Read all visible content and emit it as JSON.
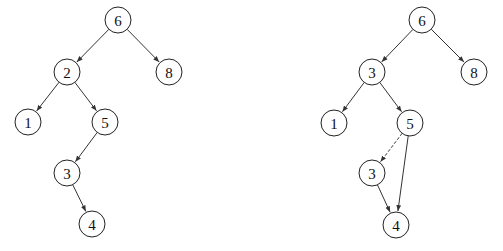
{
  "diagram": {
    "type": "binary-search-tree-comparison",
    "node_radius": 13,
    "colors": {
      "stroke": "#222222",
      "fill": "#ffffff",
      "text": "#111111"
    },
    "trees": [
      {
        "name": "left-tree",
        "nodes": [
          {
            "id": "L6",
            "label": "6",
            "x": 118,
            "y": 20
          },
          {
            "id": "L2",
            "label": "2",
            "x": 67,
            "y": 72
          },
          {
            "id": "L8",
            "label": "8",
            "x": 169,
            "y": 72
          },
          {
            "id": "L1",
            "label": "1",
            "x": 28,
            "y": 122
          },
          {
            "id": "L5",
            "label": "5",
            "x": 105,
            "y": 122
          },
          {
            "id": "L3",
            "label": "3",
            "x": 67,
            "y": 173
          },
          {
            "id": "L4",
            "label": "4",
            "x": 92,
            "y": 224
          }
        ],
        "edges": [
          {
            "from": "L6",
            "to": "L2",
            "style": "solid"
          },
          {
            "from": "L6",
            "to": "L8",
            "style": "solid"
          },
          {
            "from": "L2",
            "to": "L1",
            "style": "solid"
          },
          {
            "from": "L2",
            "to": "L5",
            "style": "solid"
          },
          {
            "from": "L5",
            "to": "L3",
            "style": "solid"
          },
          {
            "from": "L3",
            "to": "L4",
            "style": "solid"
          }
        ]
      },
      {
        "name": "right-tree",
        "nodes": [
          {
            "id": "R6",
            "label": "6",
            "x": 422,
            "y": 20
          },
          {
            "id": "R3a",
            "label": "3",
            "x": 372,
            "y": 72
          },
          {
            "id": "R8",
            "label": "8",
            "x": 474,
            "y": 72
          },
          {
            "id": "R1",
            "label": "1",
            "x": 334,
            "y": 123
          },
          {
            "id": "R5",
            "label": "5",
            "x": 410,
            "y": 123
          },
          {
            "id": "R3b",
            "label": "3",
            "x": 372,
            "y": 173
          },
          {
            "id": "R4",
            "label": "4",
            "x": 396,
            "y": 225
          }
        ],
        "edges": [
          {
            "from": "R6",
            "to": "R3a",
            "style": "solid"
          },
          {
            "from": "R6",
            "to": "R8",
            "style": "solid"
          },
          {
            "from": "R3a",
            "to": "R1",
            "style": "solid"
          },
          {
            "from": "R3a",
            "to": "R5",
            "style": "solid"
          },
          {
            "from": "R5",
            "to": "R3b",
            "style": "dashed"
          },
          {
            "from": "R5",
            "to": "R4",
            "style": "solid"
          },
          {
            "from": "R3b",
            "to": "R4",
            "style": "solid"
          }
        ]
      }
    ]
  }
}
